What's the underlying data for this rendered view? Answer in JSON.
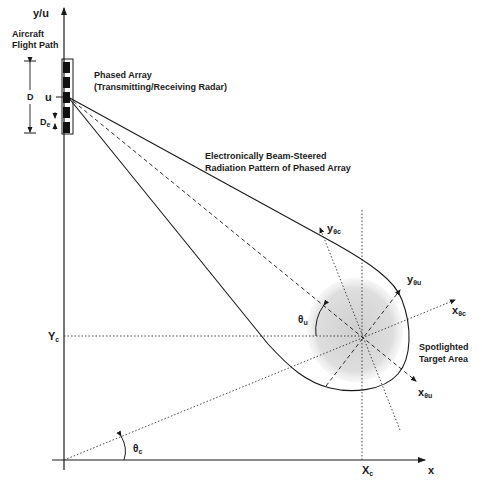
{
  "diagram": {
    "axes": {
      "y_label": "y/u",
      "x_label": "x"
    },
    "labels": {
      "flight_path_line1": "Aircraft",
      "flight_path_line2": "Flight Path",
      "array_line1": "Phased Array",
      "array_line2": "(Transmitting/Receiving Radar)",
      "beam_line1": "Electronically Beam-Steered",
      "beam_line2": "Radiation Pattern of Phased Array",
      "target_line1": "Spotlighted",
      "target_line2": "Target Area",
      "array_length": "D",
      "element_spacing": "D",
      "element_spacing_sub": "e",
      "position_u": "u",
      "yc": "Y",
      "yc_sub": "c",
      "xc": "X",
      "xc_sub": "c",
      "theta_c": "θ",
      "theta_c_sub": "c",
      "theta_u": "θ",
      "theta_u_sub": "u",
      "y_theta_c": "y",
      "y_theta_c_sub": "θc",
      "y_theta_u": "y",
      "y_theta_u_sub": "θu",
      "x_theta_c": "x",
      "x_theta_c_sub": "θc",
      "x_theta_u": "x",
      "x_theta_u_sub": "θu"
    },
    "array_elements": 5,
    "colors": {
      "ink": "#1a1a1a",
      "target_fill": "#d9d9d9",
      "background": "#ffffff"
    }
  }
}
